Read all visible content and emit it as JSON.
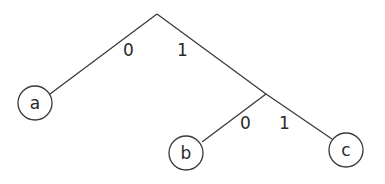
{
  "diagram": {
    "type": "binary-code-tree",
    "colors": {
      "stroke": "#3a3a3a",
      "text": "#2a2a2a",
      "background": "#ffffff"
    },
    "nodes": {
      "root": {
        "x": 157,
        "y": 14
      },
      "inner": {
        "x": 266,
        "y": 94
      },
      "a": {
        "label": "a",
        "cx": 35,
        "cy": 103,
        "r": 17
      },
      "b": {
        "label": "b",
        "cx": 186,
        "cy": 153,
        "r": 17
      },
      "c": {
        "label": "c",
        "cx": 346,
        "cy": 150,
        "r": 17
      }
    },
    "edges": [
      {
        "from": "root",
        "to": "a",
        "label": "0"
      },
      {
        "from": "root",
        "to": "inner",
        "label": "1"
      },
      {
        "from": "inner",
        "to": "b",
        "label": "0"
      },
      {
        "from": "inner",
        "to": "c",
        "label": "1"
      }
    ],
    "edge_labels": {
      "root_left": "0",
      "root_right": "1",
      "inner_left": "0",
      "inner_right": "1"
    },
    "leaf_labels": {
      "a": "a",
      "b": "b",
      "c": "c"
    }
  }
}
